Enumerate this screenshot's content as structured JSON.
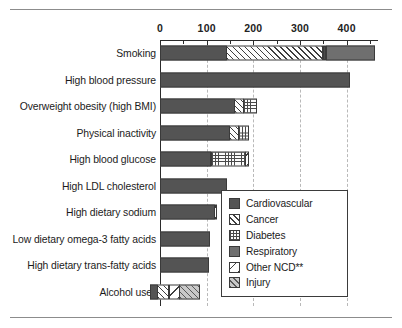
{
  "chart_data": {
    "type": "bar",
    "orientation": "horizontal",
    "stacked": true,
    "title": "",
    "subtitle": "",
    "xlabel": "",
    "ylabel": "",
    "xlim": [
      -30,
      480
    ],
    "xticks": [
      0,
      100,
      200,
      300,
      400
    ],
    "xticklabels": [
      "0",
      "100",
      "200",
      "300",
      "400"
    ],
    "grid": "vertical-dashed",
    "legend_position": "inside-right",
    "categories": [
      "Smoking",
      "High blood pressure",
      "Overweight obesity (high BMI)",
      "Physical inactivity",
      "High blood glucose",
      "High LDL cholesterol",
      "High dietary sodium",
      "Low dietary omega-3 fatty acids",
      "High dietary trans-fatty acids",
      "Alcohol use*"
    ],
    "series": [
      {
        "name": "Cardiovascular",
        "key": "cardio",
        "values": [
          144,
          407,
          160,
          150,
          110,
          144,
          118,
          107,
          105,
          0
        ]
      },
      {
        "name": "Cancer",
        "key": "cancer",
        "values": [
          290,
          0,
          22,
          20,
          0,
          0,
          0,
          0,
          0,
          22
        ]
      },
      {
        "name": "Diabetes",
        "key": "diab",
        "values": [
          8,
          0,
          30,
          25,
          75,
          0,
          0,
          0,
          0,
          0
        ]
      },
      {
        "name": "Respiratory",
        "key": "resp",
        "values": [
          465,
          0,
          0,
          0,
          0,
          0,
          0,
          0,
          0,
          0
        ]
      },
      {
        "name": "Other NCD**",
        "key": "other",
        "values": [
          0,
          0,
          0,
          0,
          10,
          0,
          6,
          0,
          0,
          24
        ]
      },
      {
        "name": "Injury",
        "key": "injury",
        "values": [
          0,
          0,
          0,
          0,
          0,
          0,
          0,
          0,
          0,
          45
        ]
      }
    ],
    "bar_segments": [
      {
        "category": "Smoking",
        "segments": [
          {
            "series": "Cardiovascular",
            "start": 0,
            "end": 144
          },
          {
            "series": "Cancer",
            "start": 144,
            "end": 352
          },
          {
            "series": "Diabetes",
            "start": 352,
            "end": 360
          },
          {
            "series": "Respiratory",
            "start": 360,
            "end": 465
          }
        ]
      },
      {
        "category": "High blood pressure",
        "segments": [
          {
            "series": "Cardiovascular",
            "start": 0,
            "end": 407
          }
        ]
      },
      {
        "category": "Overweight obesity (high BMI)",
        "segments": [
          {
            "series": "Cardiovascular",
            "start": 0,
            "end": 160
          },
          {
            "series": "Cancer",
            "start": 160,
            "end": 182
          },
          {
            "series": "Diabetes",
            "start": 182,
            "end": 212
          }
        ]
      },
      {
        "category": "Physical inactivity",
        "segments": [
          {
            "series": "Cardiovascular",
            "start": 0,
            "end": 150
          },
          {
            "series": "Cancer",
            "start": 150,
            "end": 170
          },
          {
            "series": "Diabetes",
            "start": 170,
            "end": 195
          }
        ]
      },
      {
        "category": "High blood glucose",
        "segments": [
          {
            "series": "Cardiovascular",
            "start": 0,
            "end": 110
          },
          {
            "series": "Diabetes",
            "start": 110,
            "end": 185
          },
          {
            "series": "Other NCD**",
            "start": 185,
            "end": 195
          }
        ]
      },
      {
        "category": "High LDL cholesterol",
        "segments": [
          {
            "series": "Cardiovascular",
            "start": 0,
            "end": 144
          }
        ]
      },
      {
        "category": "High dietary sodium",
        "segments": [
          {
            "series": "Cardiovascular",
            "start": 0,
            "end": 118
          },
          {
            "series": "Other NCD**",
            "start": 118,
            "end": 124
          }
        ]
      },
      {
        "category": "Low dietary omega-3 fatty acids",
        "segments": [
          {
            "series": "Cardiovascular",
            "start": 0,
            "end": 107
          }
        ]
      },
      {
        "category": "High dietary trans-fatty acids",
        "segments": [
          {
            "series": "Cardiovascular",
            "start": 0,
            "end": 105
          }
        ]
      },
      {
        "category": "Alcohol use*",
        "segments": [
          {
            "series": "Cardiovascular",
            "start": -22,
            "end": -4
          },
          {
            "series": "Cancer",
            "start": -4,
            "end": 22
          },
          {
            "series": "Other NCD**",
            "start": 22,
            "end": 46
          },
          {
            "series": "Injury",
            "start": 46,
            "end": 91
          }
        ]
      }
    ]
  },
  "legend": {
    "items": [
      {
        "label": "Cardiovascular",
        "key": "cardio"
      },
      {
        "label": "Cancer",
        "key": "cancer"
      },
      {
        "label": "Diabetes",
        "key": "diab"
      },
      {
        "label": "Respiratory",
        "key": "resp"
      },
      {
        "label": "Other NCD**",
        "key": "other"
      },
      {
        "label": "Injury",
        "key": "injury"
      }
    ]
  },
  "colors": {
    "cardiovascular": "#545454",
    "respiratory": "#6f6f6f",
    "injury": "#c9c9c9",
    "hatch": "#3d3d3d",
    "axis": "#2b2b2b",
    "grid": "#b9b9b9",
    "background": "#ffffff"
  }
}
